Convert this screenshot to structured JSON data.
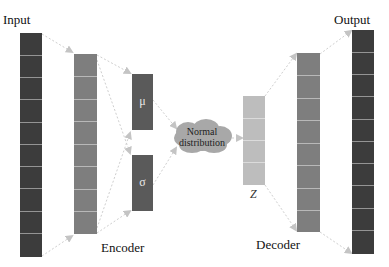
{
  "diagram": {
    "labels": {
      "input": "Input",
      "output": "Output",
      "encoder": "Encoder",
      "decoder": "Decoder",
      "mu": "μ",
      "sigma": "σ",
      "z": "Z",
      "distribution_line1": "Normal",
      "distribution_line2": "distribution"
    },
    "colors": {
      "input_output": "#3c3c3c",
      "hidden": "#7e7e7e",
      "latent_params": "#5a5a5a",
      "z": "#bdbdbd",
      "cloud": "#a8a8a8",
      "arrows": "#c4c4c4"
    }
  }
}
